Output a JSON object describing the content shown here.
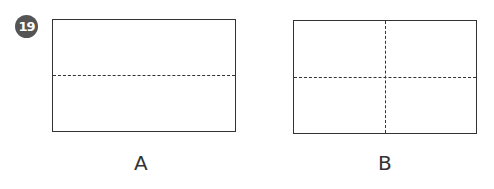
{
  "question": {
    "number": "19"
  },
  "figures": [
    {
      "label": "A",
      "shape": "rectangle",
      "dividers": [
        "horizontal-dashed"
      ],
      "parts": 2
    },
    {
      "label": "B",
      "shape": "rectangle",
      "dividers": [
        "horizontal-dashed",
        "vertical-dashed"
      ],
      "parts": 4
    }
  ],
  "colors": {
    "badge_bg": "#555555",
    "badge_text": "#ffffff",
    "line": "#333333"
  }
}
